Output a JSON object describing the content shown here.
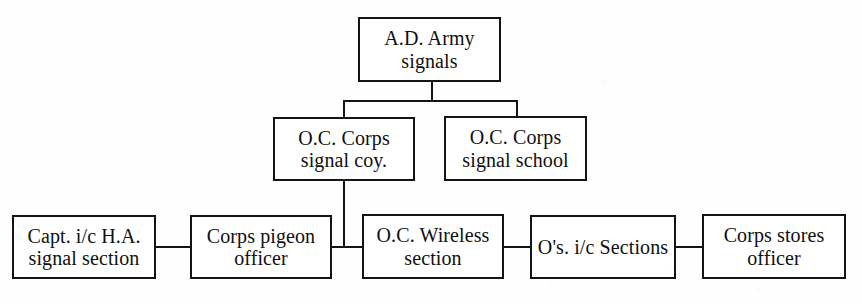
{
  "diagram": {
    "type": "organisation-chart",
    "title": "",
    "background_color": "#fefefe",
    "line_color": "#141414",
    "text_color": "#101010",
    "nodes": [
      {
        "id": "ad-army-signals",
        "label": "A.D. Army\nsignals",
        "level": 1,
        "x": 358,
        "y": 17,
        "w": 143,
        "h": 65
      },
      {
        "id": "oc-corps-signal-coy",
        "label": "O.C. Corps\nsignal coy.",
        "level": 2,
        "x": 273,
        "y": 117,
        "w": 142,
        "h": 64
      },
      {
        "id": "oc-corps-signal-school",
        "label": "O.C. Corps\nsignal school",
        "level": 2,
        "x": 444,
        "y": 116,
        "w": 143,
        "h": 65
      },
      {
        "id": "capt-ic-ha-signal-section",
        "label": "Capt. i/c H.A.\nsignal section",
        "level": 3,
        "x": 12,
        "y": 215,
        "w": 144,
        "h": 64
      },
      {
        "id": "corps-pigeon-officer",
        "label": "Corps pigeon\nofficer",
        "level": 3,
        "x": 190,
        "y": 215,
        "w": 142,
        "h": 64
      },
      {
        "id": "oc-wireless-section",
        "label": "O.C. Wireless\nsection",
        "level": 3,
        "x": 362,
        "y": 214,
        "w": 142,
        "h": 65
      },
      {
        "id": "os-ic-sections",
        "label": "O's. i/c Sections",
        "level": 3,
        "x": 530,
        "y": 215,
        "w": 146,
        "h": 64
      },
      {
        "id": "corps-stores-officer",
        "label": "Corps stores\nofficer",
        "level": 3,
        "x": 702,
        "y": 214,
        "w": 144,
        "h": 65
      }
    ],
    "edges": [
      {
        "from": "ad-army-signals",
        "to": "bus-level-2",
        "kind": "vertical-stub"
      },
      {
        "from": "bus-level-2",
        "to": "oc-corps-signal-coy",
        "kind": "vertical-drop"
      },
      {
        "from": "bus-level-2",
        "to": "oc-corps-signal-school",
        "kind": "vertical-drop"
      },
      {
        "from": "oc-corps-signal-coy",
        "to": "level-3-chain",
        "kind": "vertical-drop"
      },
      {
        "from": "capt-ic-ha-signal-section",
        "to": "corps-pigeon-officer",
        "kind": "horizontal-link"
      },
      {
        "from": "corps-pigeon-officer",
        "to": "oc-wireless-section",
        "kind": "horizontal-link"
      },
      {
        "from": "oc-wireless-section",
        "to": "os-ic-sections",
        "kind": "horizontal-link"
      },
      {
        "from": "os-ic-sections",
        "to": "corps-stores-officer",
        "kind": "horizontal-link"
      }
    ]
  }
}
